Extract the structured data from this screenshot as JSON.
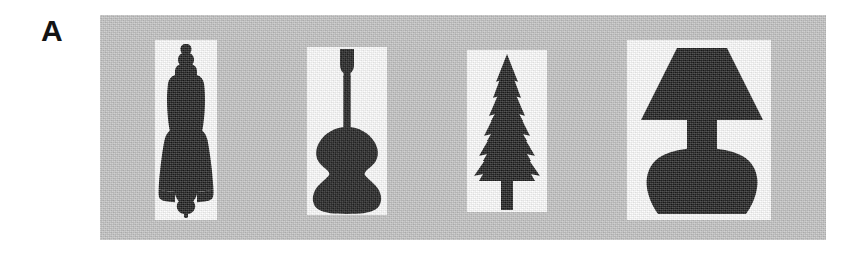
{
  "figure": {
    "panel_label": "A",
    "background_color": "#ffffff",
    "panel_background_color": "#c2c2c2",
    "silhouette_color": "#1e1e1e",
    "card_color": "#fdfdfd",
    "width": 863,
    "height": 253
  },
  "stimuli": [
    {
      "id": "figurine",
      "name": "figurine-silhouette",
      "label": "Figurine",
      "position": 1
    },
    {
      "id": "violin",
      "name": "violin-silhouette",
      "label": "Violin",
      "position": 2
    },
    {
      "id": "tree",
      "name": "pine-tree-silhouette",
      "label": "Pine tree",
      "position": 3
    },
    {
      "id": "lamp",
      "name": "table-lamp-silhouette",
      "label": "Table lamp",
      "position": 4
    }
  ]
}
